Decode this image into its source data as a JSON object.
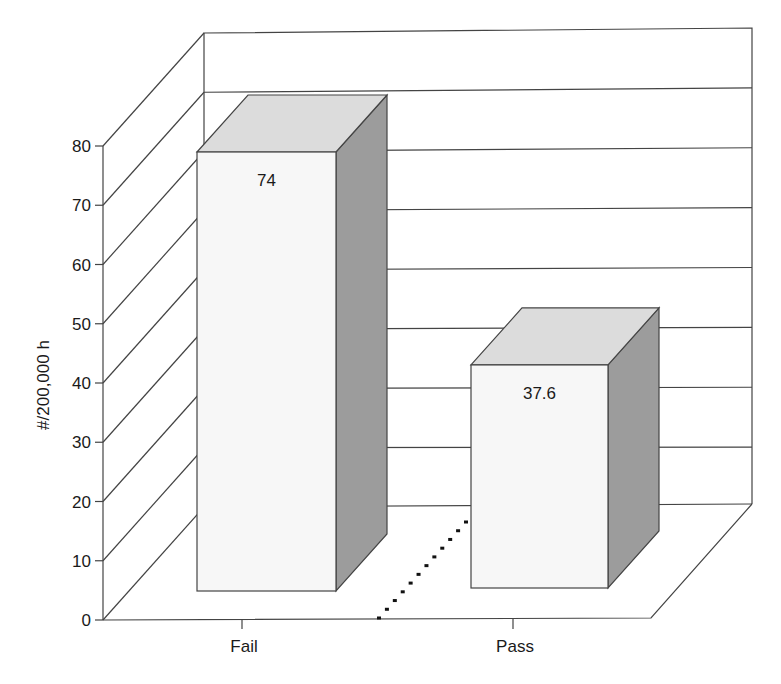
{
  "chart_data": {
    "type": "bar",
    "style": "3d-column",
    "title": "",
    "xlabel": "",
    "ylabel": "#/200,000 h",
    "categories": [
      "Fail",
      "Pass"
    ],
    "values": [
      74,
      37.6
    ],
    "data_labels": [
      "74",
      "37.6"
    ],
    "ylim": [
      0,
      80
    ],
    "yticks": [
      0,
      10,
      20,
      30,
      40,
      50,
      60,
      70,
      80
    ],
    "ytick_labels": [
      "0",
      "10",
      "20",
      "30",
      "40",
      "50",
      "60",
      "70",
      "80"
    ],
    "grid": true,
    "legend": null,
    "annotations": [
      "dotted line on floor between categories"
    ]
  },
  "colors": {
    "front_face": "#f7f7f7",
    "top_face": "#dcdcdc",
    "side_face": "#9c9c9c",
    "lines": "#444444",
    "text": "#1a1a1a"
  }
}
